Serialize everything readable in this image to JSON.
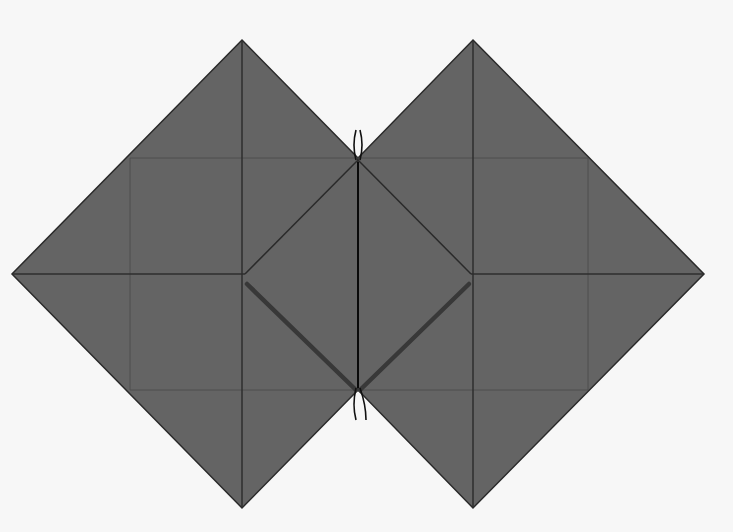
{
  "diagram": {
    "type": "origami-fold-diagram",
    "colors": {
      "background": "#f7f7f7",
      "paper": "#646464",
      "crease": "#2e2e2e",
      "faint_crease": "#4e4e4e",
      "thick_fold": "#3a3a3a",
      "center_line": "#0a0a0a"
    },
    "shapes": {
      "left_diamond": {
        "cx": 242,
        "cy": 274,
        "half": 231
      },
      "right_diamond": {
        "cx": 473,
        "cy": 274,
        "half": 231
      },
      "inner_diamond": [
        [
          245,
          275
        ],
        [
          358,
          160
        ],
        [
          471,
          275
        ],
        [
          358,
          390
        ]
      ]
    }
  }
}
